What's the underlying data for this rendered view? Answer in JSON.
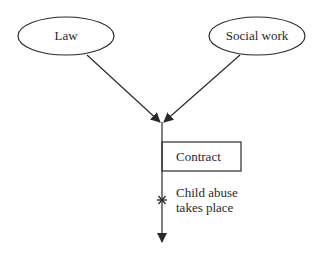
{
  "diagram": {
    "nodes": {
      "law": {
        "label": "Law",
        "shape": "ellipse"
      },
      "social_work": {
        "label": "Social work",
        "shape": "ellipse"
      },
      "contract": {
        "label": "Contract",
        "shape": "rectangle"
      }
    },
    "event": {
      "marker": "*",
      "line1": "Child abuse",
      "line2": "takes place"
    },
    "edges": [
      {
        "from": "Law",
        "to": "junction"
      },
      {
        "from": "Social work",
        "to": "junction"
      },
      {
        "from": "junction",
        "to": "timeline-end"
      }
    ],
    "colors": {
      "stroke": "#2a2a2a",
      "background": "#ffffff"
    }
  }
}
